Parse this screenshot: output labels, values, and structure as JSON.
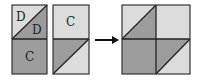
{
  "colors": {
    "light": "#dcdcdc",
    "dark": "#9c9c9c",
    "border": "#333333",
    "arrow": "#111111"
  },
  "pieces": [
    {
      "name": "piece-left",
      "top_half": {
        "type": "split-diagonal",
        "upper_left_label": "D",
        "lower_right_label": "D"
      },
      "bottom_half": {
        "type": "solid-dark",
        "label": "C"
      }
    },
    {
      "name": "piece-middle",
      "top_half": {
        "type": "solid-light",
        "label": "C"
      },
      "bottom_half": {
        "type": "split-diagonal"
      }
    }
  ],
  "arrow": {
    "direction": "right"
  },
  "result": {
    "name": "assembled-square",
    "quadrants": [
      "split-diagonal",
      "solid-light",
      "solid-dark",
      "split-diagonal"
    ]
  },
  "labels": {
    "p1_top_upper": "D",
    "p1_top_lower": "D",
    "p1_bottom": "C",
    "p2_top": "C"
  }
}
